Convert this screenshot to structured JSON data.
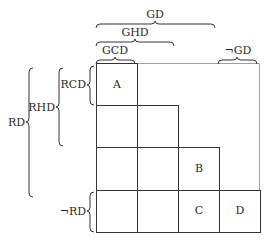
{
  "diagram": {
    "type": "nested-set grid",
    "column_braces": [
      {
        "id": "gd",
        "label": "GD",
        "span": "columns 1-3"
      },
      {
        "id": "ghd",
        "label": "GHD",
        "span": "columns 1-2"
      },
      {
        "id": "gcd",
        "label": "GCD",
        "span": "column 1"
      },
      {
        "id": "not-gd",
        "label": "¬GD",
        "span": "column 4"
      }
    ],
    "row_braces": [
      {
        "id": "rd",
        "label": "RD",
        "span": "rows 1-3"
      },
      {
        "id": "rhd",
        "label": "RHD",
        "span": "rows 1-2"
      },
      {
        "id": "rcd",
        "label": "RCD",
        "span": "row 1"
      },
      {
        "id": "not-rd",
        "label": "¬RD",
        "span": "row 4"
      }
    ],
    "cells": {
      "a": "A",
      "b": "B",
      "c": "C",
      "d": "D"
    },
    "colors": {
      "line": "#333333",
      "light_line": "#9a9a9a",
      "text": "#2a2a2a"
    }
  }
}
